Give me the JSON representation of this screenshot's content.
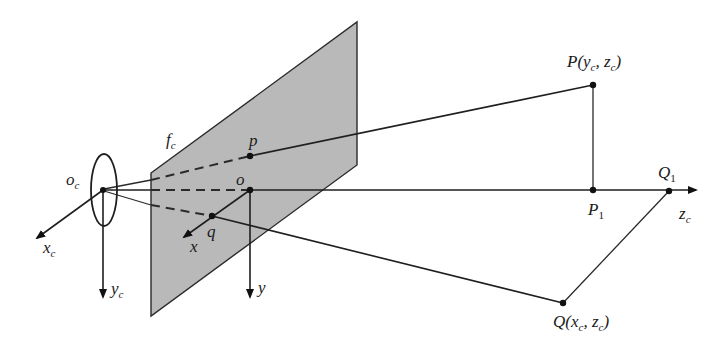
{
  "figure": {
    "colors": {
      "plane_fill": "#b9b9b9",
      "line": "#1f1f1f",
      "background": "#ffffff"
    },
    "labels": {
      "camera_origin": {
        "main": "o",
        "sub": "c"
      },
      "camera_x_axis": {
        "main": "x",
        "sub": "c"
      },
      "camera_y_axis": {
        "main": "y",
        "sub": "c"
      },
      "focal_length": {
        "main": "f",
        "sub": "c"
      },
      "image_point_p": {
        "main": "p"
      },
      "image_origin": {
        "main": "o"
      },
      "image_point_q": {
        "main": "q"
      },
      "image_x_axis": {
        "main": "x"
      },
      "image_y_axis": {
        "main": "y"
      },
      "point_P": {
        "main": "P(y",
        "sub1": "c",
        "mid": ", z",
        "sub2": "c",
        "end": ")"
      },
      "point_P1": {
        "main": "P",
        "sub": "1"
      },
      "point_Q1": {
        "main": "Q",
        "sub": "1"
      },
      "optical_axis": {
        "main": "z",
        "sub": "c"
      },
      "point_Q": {
        "main": "Q(x",
        "sub1": "c",
        "mid": ", z",
        "sub2": "c",
        "end": ")"
      }
    },
    "points": {
      "Oc": [
        103,
        190
      ],
      "p": [
        250,
        156
      ],
      "o": [
        250,
        190
      ],
      "q": [
        212,
        216
      ],
      "P": [
        593,
        85
      ],
      "P1": [
        593,
        190
      ],
      "Q1": [
        669,
        191
      ],
      "Q": [
        563,
        303
      ]
    },
    "image_plane": {
      "corners": [
        [
          151,
          173
        ],
        [
          357,
          22
        ],
        [
          357,
          165
        ],
        [
          151,
          316
        ]
      ]
    }
  }
}
